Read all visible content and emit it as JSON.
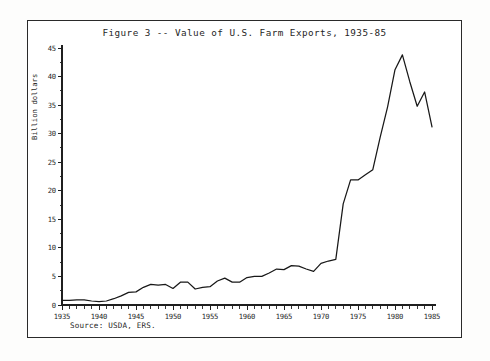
{
  "figure": {
    "title": "Figure 3 -- Value of U.S. Farm Exports, 1935-85",
    "source_note": "Source: USDA, ERS.",
    "frame_color": "#2a2a2a",
    "line_color": "#181818",
    "background_color": "#ffffff"
  },
  "chart_data": {
    "type": "line",
    "title": "Figure 3 -- Value of U.S. Farm Exports, 1935-85",
    "subtitle": "",
    "xlabel": "",
    "ylabel": "Billion dollars",
    "xlim": [
      1935,
      1985
    ],
    "ylim": [
      0,
      45
    ],
    "grid": false,
    "legend": false,
    "legend_position": "none",
    "xticks": [
      1935,
      1940,
      1945,
      1950,
      1955,
      1960,
      1965,
      1970,
      1975,
      1980,
      1985
    ],
    "xticks_minor_step": 1,
    "yticks": [
      0,
      5,
      10,
      15,
      20,
      25,
      30,
      35,
      40,
      45
    ],
    "yticks_minor_step": 2.5,
    "annotations": [
      "Source: USDA, ERS."
    ],
    "series": [
      {
        "name": "Value of U.S. Farm Exports",
        "units": "Billion dollars",
        "x": [
          1935,
          1936,
          1937,
          1938,
          1939,
          1940,
          1941,
          1942,
          1943,
          1944,
          1945,
          1946,
          1947,
          1948,
          1949,
          1950,
          1951,
          1952,
          1953,
          1954,
          1955,
          1956,
          1957,
          1958,
          1959,
          1960,
          1961,
          1962,
          1963,
          1964,
          1965,
          1966,
          1967,
          1968,
          1969,
          1970,
          1971,
          1972,
          1973,
          1974,
          1975,
          1976,
          1977,
          1978,
          1979,
          1980,
          1981,
          1982,
          1983,
          1984,
          1985
        ],
        "values": [
          0.8,
          0.8,
          0.9,
          0.9,
          0.7,
          0.6,
          0.7,
          1.1,
          1.6,
          2.2,
          2.3,
          3.1,
          3.6,
          3.5,
          3.6,
          2.9,
          4.0,
          4.0,
          2.8,
          3.1,
          3.2,
          4.2,
          4.7,
          4.0,
          4.0,
          4.8,
          5.0,
          5.0,
          5.6,
          6.3,
          6.2,
          6.9,
          6.8,
          6.3,
          5.9,
          7.3,
          7.7,
          8.0,
          17.7,
          21.9,
          21.9,
          22.8,
          23.7,
          29.4,
          34.7,
          41.2,
          43.8,
          39.1,
          34.8,
          37.3,
          31.2
        ]
      }
    ]
  },
  "axes": {
    "y_axis_title": "Billion dollars",
    "y_tick_labels": [
      "0",
      "5",
      "10",
      "15",
      "20",
      "25",
      "30",
      "35",
      "40",
      "45"
    ],
    "x_tick_labels": [
      "1935",
      "1940",
      "1945",
      "1950",
      "1955",
      "1960",
      "1965",
      "1970",
      "1975",
      "1980",
      "1985"
    ]
  }
}
